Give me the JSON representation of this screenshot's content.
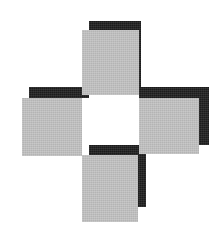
{
  "figure": {
    "canvas": {
      "width": 221,
      "height": 231,
      "background_color": "#ffffff"
    },
    "palette": {
      "gray": "#b4b4b4",
      "black": "#1b1b1b",
      "white": "#ffffff",
      "background": "#ffffff"
    },
    "shadow_offset": {
      "x": 7,
      "y": -11,
      "note": "black square is offset up and to the right of each gray square"
    },
    "shapes": [
      {
        "id": "top-shadow",
        "name": "top-arm-shadow",
        "fill": "black",
        "color": "#1b1b1b",
        "x": 89,
        "y": 21,
        "width": 52,
        "height": 74
      },
      {
        "id": "left-shadow",
        "name": "left-arm-shadow",
        "fill": "black",
        "color": "#1b1b1b",
        "x": 29,
        "y": 87,
        "width": 60,
        "height": 11
      },
      {
        "id": "right-shadow",
        "name": "right-arm-shadow",
        "fill": "black",
        "color": "#1b1b1b",
        "x": 139,
        "y": 87,
        "width": 70,
        "height": 58
      },
      {
        "id": "center-shadow",
        "name": "center-square-shadow",
        "fill": "black",
        "color": "#1b1b1b",
        "x": 89,
        "y": 145,
        "width": 57,
        "height": 62
      },
      {
        "id": "left-square",
        "name": "left-arm-square",
        "fill": "gray",
        "color": "#b4b4b4",
        "x": 22,
        "y": 98,
        "width": 60,
        "height": 58
      },
      {
        "id": "top-square",
        "name": "top-arm-square",
        "fill": "gray",
        "color": "#b4b4b4",
        "x": 82,
        "y": 30,
        "width": 57,
        "height": 65
      },
      {
        "id": "right-square",
        "name": "right-arm-square",
        "fill": "gray",
        "color": "#b4b4b4",
        "x": 139,
        "y": 98,
        "width": 60,
        "height": 56
      },
      {
        "id": "bottom-square",
        "name": "bottom-arm-square",
        "fill": "gray",
        "color": "#b4b4b4",
        "x": 82,
        "y": 155,
        "width": 56,
        "height": 67
      },
      {
        "id": "center-hole",
        "name": "center-white-square",
        "fill": "white",
        "color": "#ffffff",
        "x": 89,
        "y": 98,
        "width": 50,
        "height": 47
      }
    ]
  }
}
